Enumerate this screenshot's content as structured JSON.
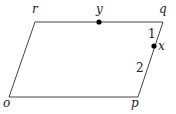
{
  "diagram": {
    "type": "parallelogram",
    "stroke_color": "#444444",
    "point_color": "#000000",
    "vertices": {
      "o": {
        "label": "o",
        "x": 9,
        "y": 97
      },
      "p": {
        "label": "p",
        "x": 138,
        "y": 97
      },
      "q": {
        "label": "q",
        "x": 163,
        "y": 22
      },
      "r": {
        "label": "r",
        "x": 35,
        "y": 22
      }
    },
    "points": {
      "y": {
        "label": "y",
        "x": 99,
        "y": 22,
        "on_segment": "rq"
      },
      "x": {
        "label": "x",
        "x": 154,
        "y": 46,
        "on_segment": "qp"
      }
    },
    "segment_labels": {
      "qx": "1",
      "xp": "2"
    }
  }
}
